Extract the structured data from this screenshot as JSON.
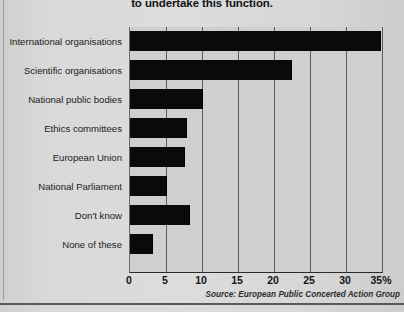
{
  "chart_data": {
    "type": "bar",
    "orientation": "horizontal",
    "title": "to undertake this function.",
    "xlabel": "",
    "ylabel": "",
    "xlim": [
      0,
      35
    ],
    "grid": true,
    "legend": null,
    "source_note": "Source: European Public Concerted Action Group",
    "xticks": [
      "0",
      "5",
      "10",
      "15",
      "20",
      "25",
      "30",
      "35%"
    ],
    "xtick_values": [
      0,
      5,
      10,
      15,
      20,
      25,
      30,
      35
    ],
    "categories": [
      "International organisations",
      "Scientific organisations",
      "National public bodies",
      "Ethics committees",
      "European Union",
      "National Parliament",
      "Don't know",
      "None of these"
    ],
    "values": [
      34.8,
      22.5,
      10.1,
      7.9,
      7.7,
      5.1,
      8.3,
      3.2
    ],
    "bar_color": "#0a0a0a",
    "plot_background": "#cfcfcf",
    "page_background": "#d8d8d8"
  }
}
